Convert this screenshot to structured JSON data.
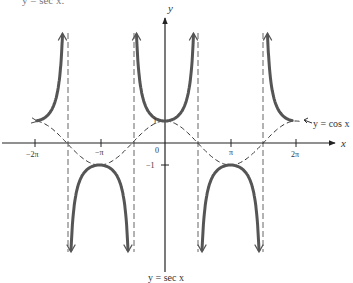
{
  "header": {
    "cut_text": "y = sec x."
  },
  "chart_data": {
    "type": "line",
    "title": "",
    "caption": "y = sec x",
    "xlabel": "x",
    "ylabel": "y",
    "xticks": [
      "-2π",
      "-π",
      "0",
      "π",
      "2π"
    ],
    "yticks": [
      "1",
      "-1"
    ],
    "xlim": [
      -6.9,
      7.3
    ],
    "asymptotes": [
      "-3π/2",
      "-π/2",
      "π/2",
      "3π/2"
    ],
    "series": [
      {
        "name": "y = sec x",
        "style": "solid-thick",
        "color": "#555555",
        "description": "secant branches: U-shapes with min 1 at x=0, ±2π; inverted U with max -1 at x=±π"
      },
      {
        "name": "y = cos x",
        "style": "dashed",
        "color": "#333333",
        "description": "cosine wave, max 1 at 0, ±2π; min -1 at ±π"
      }
    ],
    "annotations": [
      {
        "text": "y = cos x",
        "position": "right, near (2π, 1)"
      },
      {
        "text": "y = sec x",
        "position": "bottom center"
      }
    ]
  },
  "labels": {
    "y_axis": "y",
    "x_axis": "x",
    "origin": "0",
    "one": "1",
    "neg_one": "−1",
    "neg_two_pi": "−2π",
    "neg_pi": "−π",
    "pi": "π",
    "two_pi": "2π",
    "cos_label": "y = cos x",
    "sec_label": "y = sec x"
  }
}
